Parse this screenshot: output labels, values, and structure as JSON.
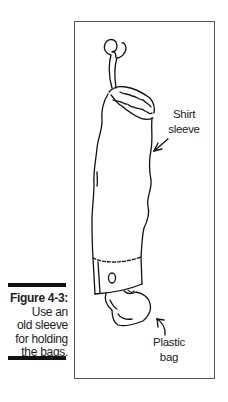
{
  "figure": {
    "number_label": "Figure 4-3:",
    "caption_lines": [
      "Use an",
      "old sleeve",
      "for holding",
      "the bags."
    ]
  },
  "illustration": {
    "labels": {
      "shirt_sleeve": [
        "Shirt",
        "sleeve"
      ],
      "plastic_bag": [
        "Plastic",
        "bag"
      ]
    },
    "colors": {
      "line": "#111111",
      "frame": "#555555",
      "bar": "#111111"
    }
  }
}
